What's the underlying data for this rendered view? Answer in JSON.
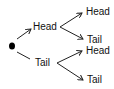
{
  "diagram": {
    "type": "probability-tree",
    "root": {
      "label": ""
    },
    "level1": [
      {
        "label": "Head"
      },
      {
        "label": "Tail"
      }
    ],
    "level2": [
      {
        "parent": "Head",
        "label": "Head"
      },
      {
        "parent": "Head",
        "label": "Tail"
      },
      {
        "parent": "Tail",
        "label": "Head"
      },
      {
        "parent": "Tail",
        "label": "Tail"
      }
    ],
    "colors": {
      "line": "#222222",
      "text": "#111111",
      "node": "#000000"
    }
  }
}
